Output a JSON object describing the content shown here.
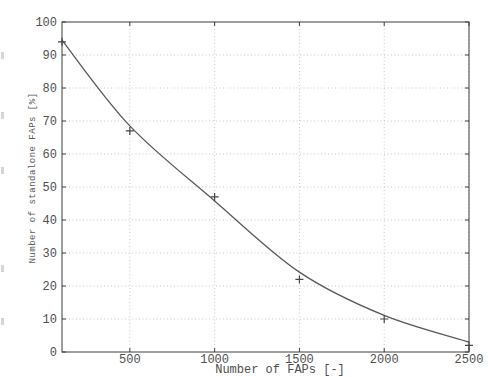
{
  "figure": {
    "colors": {
      "background": "#ffffff",
      "axis": "#3f3f3f",
      "grid": "#c9c9c9",
      "curve": "#5a5a5a",
      "marker": "#474747",
      "text": "#4f4f4f"
    }
  },
  "chart_data": {
    "type": "scatter",
    "title": "",
    "xlabel": "Number of FAPs [-]",
    "ylabel": "Number of standalone FAPs [%]",
    "xlim": [
      100,
      2500
    ],
    "ylim": [
      0,
      100
    ],
    "xticks": [
      500,
      1000,
      1500,
      2000,
      2500
    ],
    "yticks": [
      0,
      10,
      20,
      30,
      40,
      50,
      60,
      70,
      80,
      90,
      100
    ],
    "grid": "dotted",
    "legend": "none",
    "series": [
      {
        "name": "measured-points",
        "style": "markers",
        "marker": "+",
        "x": [
          100,
          500,
          1000,
          1500,
          2000,
          2500
        ],
        "y": [
          94,
          67,
          47,
          22,
          10,
          2
        ]
      },
      {
        "name": "fitted-curve",
        "style": "line",
        "x": [
          100,
          500,
          1000,
          1500,
          2000,
          2500
        ],
        "y": [
          94.5,
          68.5,
          45.8,
          24.2,
          11.1,
          3.0
        ]
      }
    ]
  }
}
